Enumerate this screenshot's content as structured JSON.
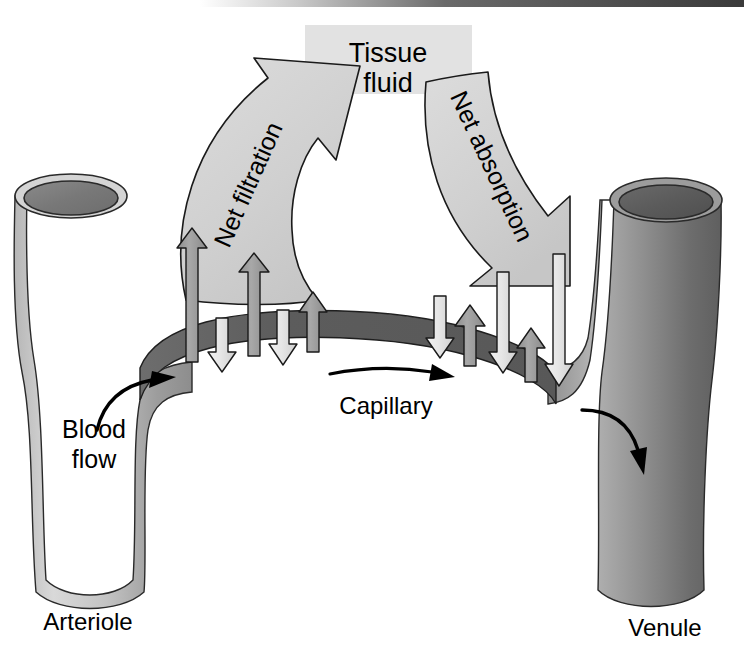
{
  "figure": {
    "width": 744,
    "height": 646,
    "background_color": "#ffffff",
    "scan_edge_color": "#4a4a4a"
  },
  "labels": {
    "tissue_fluid_line1": "Tissue",
    "tissue_fluid_line2": "fluid",
    "net_filtration": "Net filtration",
    "net_absorption": "Net absorption",
    "capillary": "Capillary",
    "blood_flow_line1": "Blood",
    "blood_flow_line2": "flow",
    "arteriole": "Arteriole",
    "venule": "Venule"
  },
  "colors": {
    "tissue_fluid_box": "#e2e2e2",
    "big_arrow_fill": "#d2d2d2",
    "big_arrow_stroke": "#1a1a1a",
    "arteriole_fill_light": "#d8d8d8",
    "arteriole_fill_mid": "#9a9a9a",
    "arteriole_lumen": "#7d7d7d",
    "venule_fill_light": "#b4b4b4",
    "venule_fill_mid": "#6e6e6e",
    "venule_lumen": "#5a5a5a",
    "capillary_fill": "#5e5e5e",
    "up_arrow_fill": "#9e9e9e",
    "down_arrow_fill": "#e8e8e8",
    "arrow_stroke": "#1a1a1a",
    "flow_arrow": "#000000",
    "text": "#000000"
  },
  "vessels": {
    "arteriole": {
      "name": "Arteriole",
      "side": "left",
      "shade": "light-gray",
      "lumen_visible": true
    },
    "venule": {
      "name": "Venule",
      "side": "right",
      "shade": "dark-gray",
      "lumen_visible": true
    },
    "capillary": {
      "name": "Capillary",
      "shape": "arched band",
      "shade": "dark-gray"
    }
  },
  "pressure_arrows": {
    "description": "Small arrows across the capillary wall. Up arrows = outward filtration force, down arrows = inward absorption force.",
    "arteriolar_end": {
      "region": "net filtration",
      "items": [
        {
          "index": 1,
          "direction": "up",
          "x": 192,
          "length": 133,
          "tone": "dark"
        },
        {
          "index": 2,
          "direction": "down",
          "x": 222,
          "length": 51,
          "tone": "light"
        },
        {
          "index": 3,
          "direction": "up",
          "x": 254,
          "length": 101,
          "tone": "dark"
        },
        {
          "index": 4,
          "direction": "down",
          "x": 283,
          "length": 55,
          "tone": "light"
        },
        {
          "index": 5,
          "direction": "up",
          "x": 313,
          "length": 62,
          "tone": "dark"
        }
      ]
    },
    "venular_end": {
      "region": "net absorption",
      "items": [
        {
          "index": 1,
          "direction": "down",
          "x": 440,
          "length": 62,
          "tone": "light"
        },
        {
          "index": 2,
          "direction": "up",
          "x": 470,
          "length": 61,
          "tone": "dark"
        },
        {
          "index": 3,
          "direction": "down",
          "x": 503,
          "length": 99,
          "tone": "light"
        },
        {
          "index": 4,
          "direction": "up",
          "x": 531,
          "length": 53,
          "tone": "dark"
        },
        {
          "index": 5,
          "direction": "down",
          "x": 559,
          "length": 131,
          "tone": "light"
        }
      ]
    }
  },
  "flow_arrows": [
    {
      "name": "blood-flow-in",
      "from": "arteriole",
      "to": "capillary",
      "direction": "right"
    },
    {
      "name": "capillary-flow",
      "from": "capillary",
      "to": "capillary",
      "direction": "right"
    },
    {
      "name": "blood-flow-out",
      "from": "capillary",
      "to": "venule",
      "direction": "down"
    }
  ]
}
